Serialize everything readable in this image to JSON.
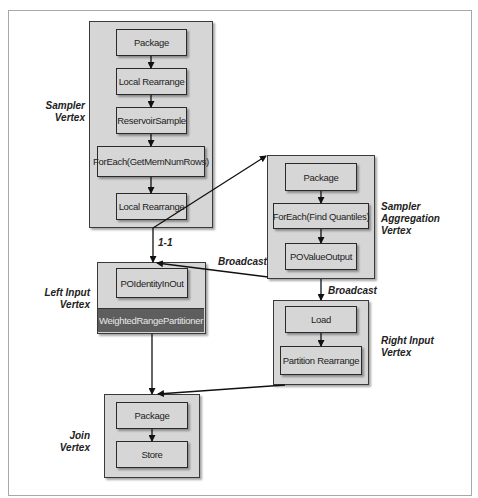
{
  "diagram": {
    "vertices": {
      "sampler": {
        "label_line1": "Sampler",
        "label_line2": "Vertex",
        "ops": [
          "Package",
          "Local Rearrange",
          "ReservoirSample",
          "ForEach(GetMemNumRows)",
          "Local Rearrange"
        ]
      },
      "sampler_aggregation": {
        "label_line1": "Sampler",
        "label_line2": "Aggregation",
        "label_line3": "Vertex",
        "ops": [
          "Package",
          "ForEach(Find Quantiles)",
          "POValueOutput"
        ]
      },
      "left_input": {
        "label_line1": "Left Input",
        "label_line2": "Vertex",
        "ops": [
          "POIdentityInOut"
        ],
        "partitioner": "WeightedRangePartitioner"
      },
      "right_input": {
        "label_line1": "Right Input",
        "label_line2": "Vertex",
        "ops": [
          "Load",
          "Partition Rearrange"
        ]
      },
      "join": {
        "label_line1": "Join",
        "label_line2": "Vertex",
        "ops": [
          "Package",
          "Store"
        ]
      }
    },
    "edges": {
      "sampler_to_left": "1-1",
      "aggregation_to_left": "Broadcast",
      "aggregation_to_right": "Broadcast"
    },
    "colors": {
      "vertex_fill": "#d6d6d6",
      "partitioner_fill": "#5e5e5e",
      "stroke": "#2a2a2a"
    }
  }
}
